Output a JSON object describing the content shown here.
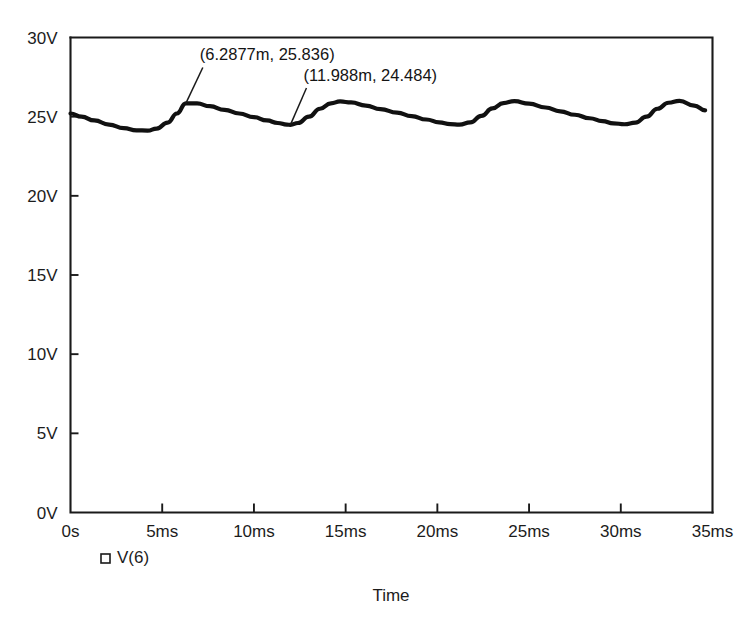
{
  "chart_data": {
    "type": "line",
    "title": "",
    "xlabel": "Time",
    "ylabel": "",
    "xlim": [
      0,
      35
    ],
    "ylim": [
      0,
      30
    ],
    "x_unit": "ms",
    "y_unit": "V",
    "grid": false,
    "legend_position": "bottom-left",
    "x_tick_labels": [
      "0s",
      "5ms",
      "10ms",
      "15ms",
      "20ms",
      "25ms",
      "30ms",
      "35ms"
    ],
    "x_tick_values": [
      0,
      5,
      10,
      15,
      20,
      25,
      30,
      35
    ],
    "y_tick_labels": [
      "0V",
      "5V",
      "10V",
      "15V",
      "20V",
      "25V",
      "30V"
    ],
    "y_tick_values": [
      0,
      5,
      10,
      15,
      20,
      25,
      30
    ],
    "series": [
      {
        "name": "V(6)",
        "color": "#111111",
        "marker": "square",
        "x": [
          0.0,
          0.6,
          1.3,
          2.1,
          2.9,
          3.6,
          4.2,
          4.7,
          5.3,
          5.8,
          6.29,
          6.9,
          7.6,
          8.4,
          9.2,
          10.0,
          10.7,
          11.3,
          11.8,
          11.99,
          12.4,
          13.0,
          13.6,
          14.2,
          14.7,
          15.3,
          16.1,
          16.9,
          17.8,
          18.6,
          19.4,
          20.1,
          20.7,
          21.2,
          21.8,
          22.4,
          23.0,
          23.6,
          24.2,
          25.0,
          25.9,
          26.7,
          27.5,
          28.3,
          29.0,
          29.6,
          30.2,
          30.8,
          31.4,
          32.0,
          32.6,
          33.2,
          34.0,
          34.6
        ],
        "y": [
          25.2,
          25.0,
          24.76,
          24.5,
          24.28,
          24.14,
          24.12,
          24.25,
          24.63,
          25.2,
          25.836,
          25.84,
          25.66,
          25.43,
          25.2,
          24.97,
          24.76,
          24.6,
          24.5,
          24.484,
          24.6,
          25.0,
          25.5,
          25.84,
          25.96,
          25.9,
          25.7,
          25.48,
          25.26,
          25.04,
          24.82,
          24.64,
          24.53,
          24.5,
          24.64,
          25.05,
          25.52,
          25.86,
          25.98,
          25.82,
          25.58,
          25.34,
          25.12,
          24.9,
          24.72,
          24.58,
          24.52,
          24.62,
          25.0,
          25.5,
          25.88,
          26.0,
          25.7,
          25.4
        ]
      }
    ],
    "annotations": [
      {
        "text": "(6.2877m, 25.836)",
        "point_x": 6.2877,
        "point_y": 25.836,
        "label_x": 7.05,
        "label_y": 28.55
      },
      {
        "text": "(11.988m, 24.484)",
        "point_x": 11.988,
        "point_y": 24.484,
        "label_x": 12.7,
        "label_y": 27.25
      }
    ]
  },
  "legend": {
    "entries": [
      {
        "label": "V(6)",
        "marker": "square-outline"
      }
    ]
  },
  "axis": {
    "x_title": "Time"
  }
}
